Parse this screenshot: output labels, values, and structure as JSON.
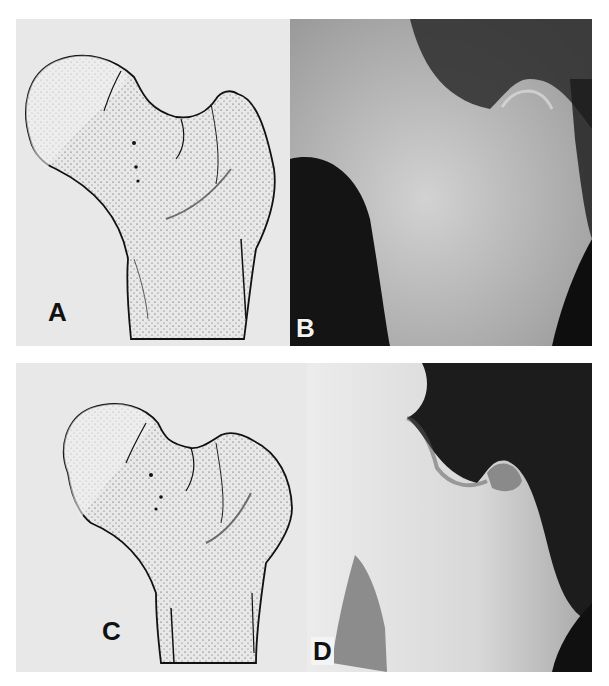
{
  "figure": {
    "layout": "2x2 grid",
    "panels": [
      {
        "id": "A",
        "label": "A",
        "type": "illustration",
        "subject": "proximal femur line-stipple drawing",
        "signature": "illegible artist signature"
      },
      {
        "id": "B",
        "label": "B",
        "type": "radiograph",
        "subject": "proximal femur X-ray"
      },
      {
        "id": "C",
        "label": "C",
        "type": "illustration",
        "subject": "proximal femur line-stipple drawing",
        "signature": "illegible artist signature"
      },
      {
        "id": "D",
        "label": "D",
        "type": "radiograph",
        "subject": "proximal femur X-ray"
      }
    ],
    "colors": {
      "page_bg": "#ffffff",
      "drawing_bg": "#e9e9e9",
      "ink": "#1a1a1a",
      "xray_dark": "#0d0d0d",
      "xray_bone": "#d9d9d9"
    }
  }
}
